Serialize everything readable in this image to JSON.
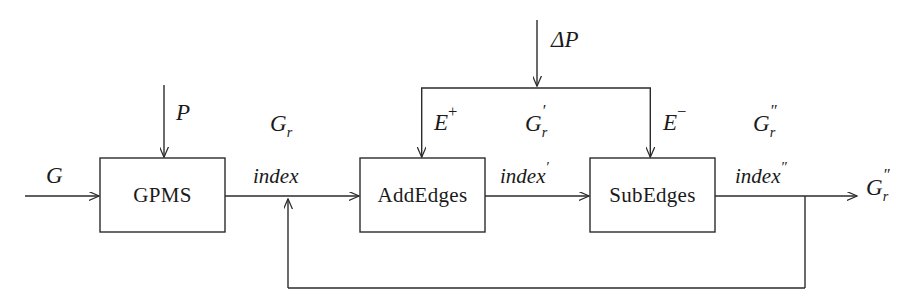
{
  "diagram": {
    "type": "block-flow-diagram",
    "stroke_color": "#2b2b2b",
    "background_color": "#ffffff",
    "blocks": [
      {
        "id": "gpms",
        "label": "GPMS",
        "x": 100,
        "y": 158,
        "w": 125,
        "h": 74
      },
      {
        "id": "addedges",
        "label": "AddEdges",
        "x": 360,
        "y": 158,
        "w": 125,
        "h": 74
      },
      {
        "id": "subedges",
        "label": "SubEdges",
        "x": 590,
        "y": 158,
        "w": 125,
        "h": 74
      }
    ],
    "labels": {
      "input_graph": "G",
      "pattern_input": "P",
      "delta_pattern": "ΔP",
      "gpms_output_graph": "G",
      "gpms_output_graph_sub": "r",
      "gpms_output_index": "index",
      "added_edges": "E",
      "added_edges_sup": "+",
      "addedges_output_graph": "G",
      "addedges_output_graph_sub": "r",
      "addedges_output_graph_prime": "′",
      "addedges_output_index": "index",
      "addedges_output_index_prime": "′",
      "subtracted_edges": "E",
      "subtracted_edges_sup": "−",
      "subedges_output_graph": "G",
      "subedges_output_graph_sub": "r",
      "subedges_output_graph_prime": "″",
      "subedges_output_index": "index",
      "subedges_output_index_prime": "″",
      "final_output_graph": "G",
      "final_output_graph_sub": "r",
      "final_output_graph_prime": "″"
    },
    "edges": [
      {
        "id": "g-to-gpms",
        "from": "G",
        "to": "gpms",
        "kind": "arrow"
      },
      {
        "id": "p-to-gpms",
        "from": "P",
        "to": "gpms",
        "kind": "arrow"
      },
      {
        "id": "gpms-to-addedges",
        "from": "gpms",
        "to": "addedges",
        "kind": "arrow",
        "label": "index"
      },
      {
        "id": "deltap-split",
        "from": "ΔP",
        "to": "split-bar",
        "kind": "arrow"
      },
      {
        "id": "split-to-addedges",
        "from": "split-bar",
        "to": "addedges",
        "kind": "arrow",
        "label": "E+"
      },
      {
        "id": "split-to-subedges",
        "from": "split-bar",
        "to": "subedges",
        "kind": "arrow",
        "label": "E−"
      },
      {
        "id": "addedges-to-subedges",
        "from": "addedges",
        "to": "subedges",
        "kind": "arrow",
        "label": "index′"
      },
      {
        "id": "subedges-to-output",
        "from": "subedges",
        "to": "output",
        "kind": "arrow",
        "label": "index″"
      },
      {
        "id": "feedback-loop",
        "from": "subedges-output-tap",
        "to": "gpms-to-addedges-line",
        "kind": "arrow"
      }
    ]
  }
}
